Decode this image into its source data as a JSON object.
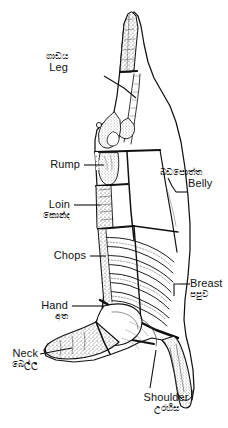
{
  "figure": {
    "title": "",
    "languages": [
      "English",
      "Sinhala"
    ],
    "ink_color": "#111111",
    "background_color": "#ffffff"
  },
  "labels": [
    {
      "id": "leg",
      "en": "Leg",
      "si": "ගාඩය",
      "side": "left",
      "order": 1
    },
    {
      "id": "rump",
      "en": "Rump",
      "si": "",
      "side": "left",
      "order": 2
    },
    {
      "id": "loin",
      "en": "Loin",
      "si": "කොන්ද",
      "side": "left",
      "order": 3
    },
    {
      "id": "chops",
      "en": "Chops",
      "si": "",
      "side": "left",
      "order": 4
    },
    {
      "id": "hand",
      "en": "Hand",
      "si": "අත",
      "side": "left",
      "order": 5
    },
    {
      "id": "neck",
      "en": "Neck",
      "si": "බෙල්ල",
      "side": "left",
      "order": 6
    },
    {
      "id": "belly",
      "en": "Belly",
      "si": "බඩපොත්ත",
      "side": "right",
      "order": 7
    },
    {
      "id": "breast",
      "en": "Breast",
      "si": "පපුව",
      "side": "right",
      "order": 8
    },
    {
      "id": "shoulder",
      "en": "Shoulder",
      "si": "උරහිස",
      "side": "bottom",
      "order": 9
    }
  ]
}
